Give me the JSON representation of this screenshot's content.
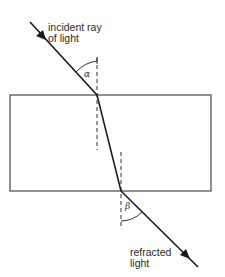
{
  "diagram": {
    "labels": {
      "incident_line1": "incident ray",
      "incident_line2": "of light",
      "refracted_line1": "refracted",
      "refracted_line2": "light",
      "angle_incidence": "α",
      "angle_refraction": "β"
    },
    "colors": {
      "line": "#1a1a1a",
      "block_outline": "#555555",
      "background": "#ffffff"
    }
  }
}
